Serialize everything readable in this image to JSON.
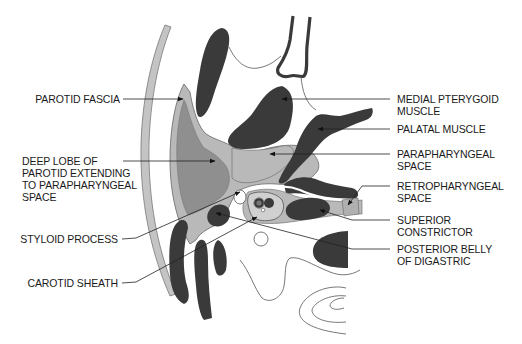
{
  "diagram": {
    "type": "anatomical-cross-section",
    "colors": {
      "muscle": "#3a3a3a",
      "parotid_deep_lobe": "#8f8f8f",
      "parotid_fascia_space": "#b9b9b9",
      "skin_band": "#c4c4c4",
      "outline": "#555555",
      "background": "#ffffff",
      "label_text": "#1a1a1a",
      "leader_line": "#222222"
    }
  },
  "labels": {
    "left": [
      {
        "id": "parotid-fascia",
        "lines": [
          "PAROTID FASCIA"
        ]
      },
      {
        "id": "deep-lobe",
        "lines": [
          "DEEP LOBE OF",
          "PAROTID EXTENDING",
          "TO PARAPHARYNGEAL",
          "SPACE"
        ]
      },
      {
        "id": "styloid-process",
        "lines": [
          "STYLOID PROCESS"
        ]
      },
      {
        "id": "carotid-sheath",
        "lines": [
          "CAROTID SHEATH"
        ]
      }
    ],
    "right": [
      {
        "id": "medial-pterygoid",
        "lines": [
          "MEDIAL PTERYGOID",
          "MUSCLE"
        ]
      },
      {
        "id": "palatal-muscle",
        "lines": [
          "PALATAL MUSCLE"
        ]
      },
      {
        "id": "parapharyngeal-space",
        "lines": [
          "PARAPHARYNGEAL",
          "SPACE"
        ]
      },
      {
        "id": "retropharyngeal-space",
        "lines": [
          "RETROPHARYNGEAL",
          "SPACE"
        ]
      },
      {
        "id": "superior-constrictor",
        "lines": [
          "SUPERIOR",
          "CONSTRICTOR"
        ]
      },
      {
        "id": "posterior-belly-digastric",
        "lines": [
          "POSTERIOR BELLY",
          "OF DIGASTRIC"
        ]
      }
    ]
  }
}
